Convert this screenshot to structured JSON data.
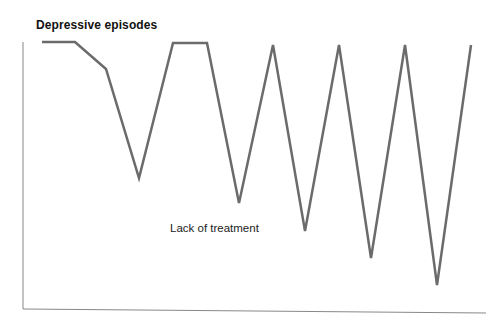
{
  "chart_data": {
    "type": "line",
    "title": "Depressive episodes",
    "xlabel": "",
    "ylabel": "",
    "grid": false,
    "legend": null,
    "annotations": [
      "Lack of treatment"
    ],
    "series": [
      {
        "name": "Mood",
        "color": "#6b6b6b",
        "x": [
          0,
          1,
          2,
          3,
          4,
          5,
          6,
          7,
          8,
          9,
          10,
          11,
          12,
          13
        ],
        "values": [
          100,
          100,
          90,
          50,
          100,
          100,
          40,
          100,
          30,
          100,
          20,
          100,
          10,
          100
        ]
      }
    ],
    "points_px": [
      [
        42,
        42
      ],
      [
        75,
        42
      ],
      [
        106,
        69
      ],
      [
        139,
        178
      ],
      [
        173,
        43
      ],
      [
        207,
        43
      ],
      [
        239,
        203
      ],
      [
        273,
        45
      ],
      [
        305,
        231
      ],
      [
        339,
        45
      ],
      [
        371,
        258
      ],
      [
        405,
        45
      ],
      [
        437,
        285
      ],
      [
        471,
        45
      ]
    ]
  },
  "labels": {
    "title": "Depressive episodes",
    "annotation": "Lack of treatment"
  }
}
